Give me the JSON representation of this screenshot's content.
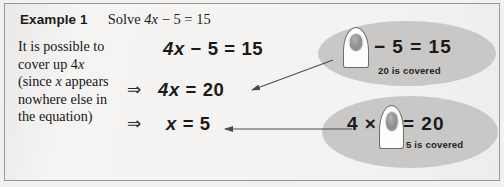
{
  "header": {
    "example_label": "Example 1",
    "solve_prefix": "Solve ",
    "solve_var": "4x",
    "solve_rest": " − 5 = 15"
  },
  "prose": {
    "line1": "It is possible to",
    "line2_pre": "cover up 4",
    "line2_var": "x",
    "line3_pre": "(since ",
    "line3_var": "x",
    "line3_post": " appears",
    "line4": "nowhere else in",
    "line5": "the equation)"
  },
  "working": {
    "implies_1": "⇒",
    "implies_2": "⇒",
    "equation_1_var": "4x",
    "equation_1_rest": " − 5 = 15",
    "equation_2_var": "4x",
    "equation_2_rest": " = 20",
    "equation_3_var": "x",
    "equation_3_rest": " = 5"
  },
  "callouts": [
    {
      "id": "top",
      "icon": "finger-covering-icon",
      "equation_after_finger": "− 5 = 15",
      "caption": "20 is covered",
      "covered_value": "20",
      "ellipse_color": "#c9c8c7"
    },
    {
      "id": "bottom",
      "icon": "finger-covering-icon",
      "equation_before_finger": "4 ×",
      "equation_after_finger": "= 20",
      "caption": "5 is covered",
      "covered_value": "5",
      "ellipse_color": "#c9c8c7"
    }
  ],
  "colors": {
    "page_background": "#f2f1ef",
    "paper": "#f4f3f1",
    "border": "#9a9896",
    "text": "#1a1a1a",
    "arrow": "#4a4a4a"
  }
}
